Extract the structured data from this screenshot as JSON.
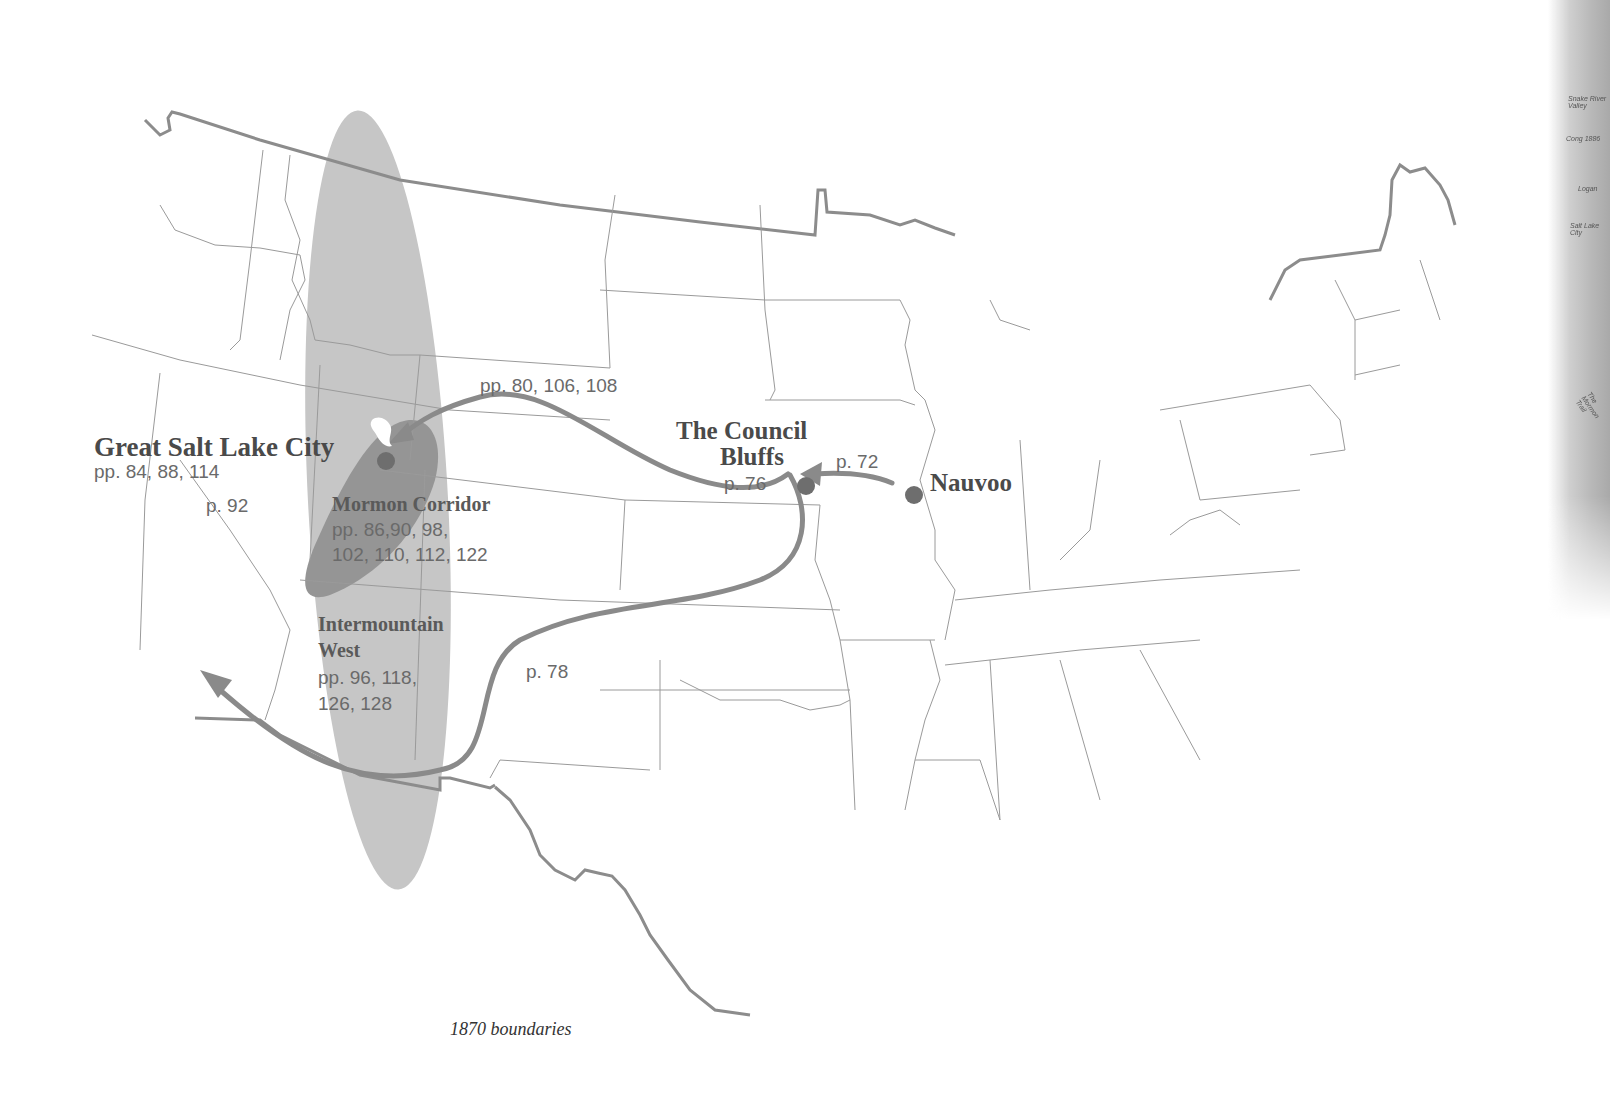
{
  "map": {
    "caption": "1870 boundaries",
    "places": {
      "great_salt_lake_city": {
        "name": "Great Salt Lake City",
        "pages": "pp. 84, 88, 114"
      },
      "council_bluffs": {
        "name_line1": "The Council",
        "name_line2": "Bluffs",
        "pages": "p. 76"
      },
      "nauvoo": {
        "name": "Nauvoo"
      }
    },
    "regions": {
      "mormon_corridor": {
        "name": "Mormon Corridor",
        "pages_line1": "pp. 86,90, 98,",
        "pages_line2": "102, 110, 112, 122"
      },
      "intermountain_west": {
        "name_line1": "Intermountain",
        "name_line2": "West",
        "pages_line1": "pp. 96, 118,",
        "pages_line2": "126, 128"
      }
    },
    "routes": {
      "nauvoo_to_council_bluffs": "p. 72",
      "council_bluffs_to_salt_lake": "pp. 80, 106, 108",
      "council_bluffs_southwest": "p. 78",
      "salt_lake_southwest": "p. 92"
    },
    "side_strip_labels": [
      "Snake River Valley",
      "Cong 1886",
      "Logan",
      "Salt Lake City",
      "The Mormon Trail"
    ],
    "colors": {
      "route": "#8a8a8a",
      "marker": "#6e6e6e",
      "corridor_dark": "#8f8f8f",
      "region_light": "#c4c4c4",
      "boundary": "#9a9a9a",
      "border": "#8c8c8c"
    }
  }
}
